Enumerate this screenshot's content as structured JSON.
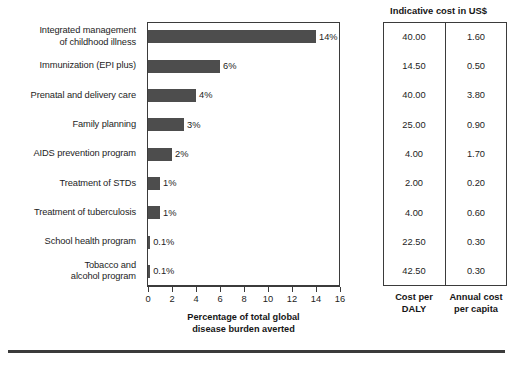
{
  "chart_data": {
    "type": "bar",
    "orientation": "horizontal",
    "title": "",
    "xlabel": "Percentage of total global disease burden averted",
    "ylabel": "",
    "xlim": [
      0,
      16
    ],
    "xticks": [
      0,
      2,
      4,
      6,
      8,
      10,
      12,
      14,
      16
    ],
    "grid": false,
    "legend": null,
    "bar_color": "#4d4d4d",
    "categories": [
      "Integrated management of childhood illness",
      "Immunization (EPI plus)",
      "Prenatal and delivery care",
      "Family planning",
      "AIDS prevention program",
      "Treatment of STDs",
      "Treatment of tuberculosis",
      "School health program",
      "Tobacco and alcohol program"
    ],
    "values": [
      14,
      6,
      4,
      3,
      2,
      1,
      1,
      0.1,
      0.1
    ],
    "data_labels": [
      "14%",
      "6%",
      "4%",
      "3%",
      "2%",
      "1%",
      "1%",
      "0.1%",
      "0.1%"
    ]
  },
  "chart": {
    "category_labels": [
      [
        "Integrated management",
        "of childhood illness"
      ],
      [
        "Immunization (EPI plus)"
      ],
      [
        "Prenatal and delivery care"
      ],
      [
        "Family planning"
      ],
      [
        "AIDS prevention program"
      ],
      [
        "Treatment of STDs"
      ],
      [
        "Treatment of tuberculosis"
      ],
      [
        "School health program"
      ],
      [
        "Tobacco and",
        "alcohol program"
      ]
    ],
    "xaxis_title_lines": [
      "Percentage of total global",
      "disease burden averted"
    ],
    "tick_labels": [
      "0",
      "2",
      "4",
      "6",
      "8",
      "10",
      "12",
      "14",
      "16"
    ]
  },
  "table": {
    "title": "Indicative cost in US$",
    "column_footers": [
      [
        "Cost per",
        "DALY"
      ],
      [
        "Annual cost",
        "per capita"
      ]
    ],
    "rows": [
      {
        "cost_per_daly": "40.00",
        "annual_cost_per_capita": "1.60"
      },
      {
        "cost_per_daly": "14.50",
        "annual_cost_per_capita": "0.50"
      },
      {
        "cost_per_daly": "40.00",
        "annual_cost_per_capita": "3.80"
      },
      {
        "cost_per_daly": "25.00",
        "annual_cost_per_capita": "0.90"
      },
      {
        "cost_per_daly": "4.00",
        "annual_cost_per_capita": "1.70"
      },
      {
        "cost_per_daly": "2.00",
        "annual_cost_per_capita": "0.20"
      },
      {
        "cost_per_daly": "4.00",
        "annual_cost_per_capita": "0.60"
      },
      {
        "cost_per_daly": "22.50",
        "annual_cost_per_capita": "0.30"
      },
      {
        "cost_per_daly": "42.50",
        "annual_cost_per_capita": "0.30"
      }
    ]
  }
}
